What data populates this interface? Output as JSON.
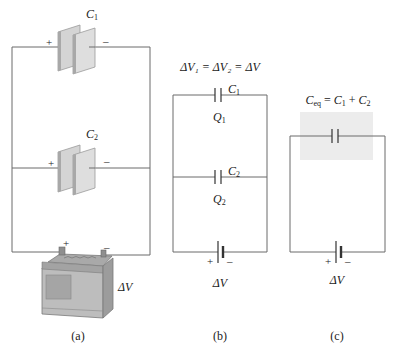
{
  "figure": {
    "panels": [
      {
        "id": "a",
        "caption": "(a)",
        "capacitors": [
          {
            "name": "C",
            "sub": "1",
            "plus": "+",
            "minus": "–"
          },
          {
            "name": "C",
            "sub": "2",
            "plus": "+",
            "minus": "–"
          }
        ],
        "battery": {
          "plus": "+",
          "minus": "–",
          "label": "ΔV"
        }
      },
      {
        "id": "b",
        "caption": "(b)",
        "equation": "ΔV₁ = ΔV₂ = ΔV",
        "capacitors": [
          {
            "name": "C",
            "sub": "1",
            "charge": "Q",
            "charge_sub": "1"
          },
          {
            "name": "C",
            "sub": "2",
            "charge": "Q",
            "charge_sub": "2"
          }
        ],
        "battery": {
          "plus": "+",
          "minus": "–",
          "label": "ΔV"
        }
      },
      {
        "id": "c",
        "caption": "(c)",
        "equation": "C_eq = C₁ + C₂",
        "equation_parts": {
          "lhs": "C",
          "lhs_sub": "eq",
          "eq": " = ",
          "t1": "C",
          "t1_sub": "1",
          "plus": " + ",
          "t2": "C",
          "t2_sub": "2"
        },
        "battery": {
          "plus": "+",
          "minus": "–",
          "label": "ΔV"
        }
      }
    ],
    "colors": {
      "wire": "#6b6b6b",
      "plate_face": "#d9d9d9",
      "plate_edge": "#9a9a9a",
      "highlight_box": "#ececec",
      "battery_body": "#b5b5b5",
      "battery_dark": "#8c8c8c"
    }
  }
}
